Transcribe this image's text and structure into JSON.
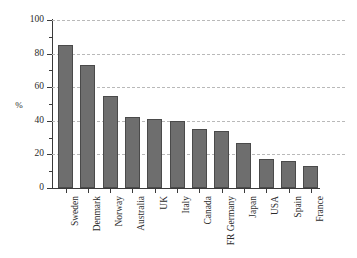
{
  "chart_data": {
    "type": "bar",
    "title": "",
    "subtitle": "",
    "xlabel": "",
    "ylabel": "%",
    "ylim": [
      0,
      100
    ],
    "ytick_labels": [
      "0",
      "20",
      "40",
      "60",
      "80",
      "100"
    ],
    "ytick_values": [
      0,
      20,
      40,
      60,
      80,
      100
    ],
    "yminor_values": [
      10,
      30,
      50,
      70,
      90
    ],
    "grid": true,
    "grid_axis": "y",
    "grid_style": "dashed",
    "legend": false,
    "legend_position": "none",
    "categories": [
      "Sweden",
      "Denmark",
      "Norway",
      "Australia",
      "UK",
      "Italy",
      "Canada",
      "FR Germany",
      "Japan",
      "USA",
      "Spain",
      "France"
    ],
    "values": [
      85,
      73,
      55,
      42,
      41,
      40,
      35,
      34,
      27,
      17,
      16,
      13
    ],
    "bar_color": "#6e6e6e",
    "bar_edge_color": "#4a4a4a",
    "grid_color": "#b9b9b9",
    "axis_color": "#3a3a3a",
    "background_color": "#ffffff"
  }
}
